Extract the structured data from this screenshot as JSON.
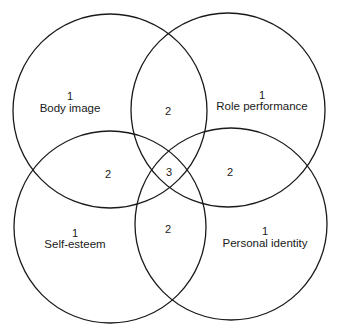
{
  "diagram": {
    "type": "venn-4-circle",
    "stroke_color": "#1a1a1a",
    "background": "#ffffff",
    "circles": [
      {
        "name": "Body image",
        "cx": 110,
        "cy": 111,
        "r": 97
      },
      {
        "name": "Role performance",
        "cx": 228,
        "cy": 110,
        "r": 97
      },
      {
        "name": "Self-esteem",
        "cx": 110,
        "cy": 227,
        "r": 96
      },
      {
        "name": "Personal identity",
        "cx": 231,
        "cy": 224,
        "r": 96
      }
    ],
    "regions": {
      "body_image": {
        "count": "1",
        "label": "Body image"
      },
      "role_performance": {
        "count": "1",
        "label": "Role performance"
      },
      "self_esteem": {
        "count": "1",
        "label": "Self-esteem"
      },
      "personal_identity": {
        "count": "1",
        "label": "Personal identity"
      },
      "overlap_top": "2",
      "overlap_left": "2",
      "overlap_center": "3",
      "overlap_right": "2",
      "overlap_bottom": "2"
    }
  }
}
